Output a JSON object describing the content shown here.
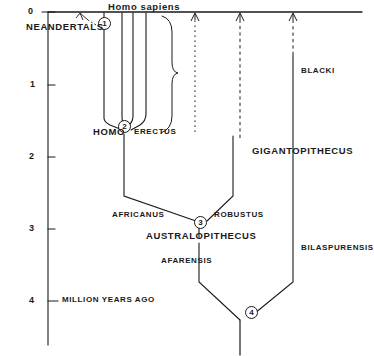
{
  "figure": {
    "type": "phylogenetic-tree-diagram",
    "style": "hand-drawn line art, black ink on white",
    "width": 364,
    "height": 356,
    "ink_color": "#1a1a1a",
    "background_color": "#ffffff"
  },
  "axis": {
    "orientation": "vertical-left",
    "label": "MILLION YEARS AGO",
    "label_x": 62,
    "label_y": 296,
    "ticks": [
      {
        "value": "0",
        "y": 12
      },
      {
        "value": "1",
        "y": 85
      },
      {
        "value": "2",
        "y": 157
      },
      {
        "value": "3",
        "y": 229
      },
      {
        "value": "4",
        "y": 301
      }
    ],
    "axis_x": 48,
    "axis_top": 12,
    "axis_bottom": 345,
    "units": "million years ago",
    "range": [
      0,
      4
    ]
  },
  "top_axis": {
    "present_line_y": 12,
    "present_line_x1": 48,
    "present_line_x2": 362
  },
  "taxa": [
    {
      "name": "Homo sapiens",
      "text": "Homo sapiens",
      "x": 108,
      "y": 4,
      "style": "cap"
    },
    {
      "name": "Neandertals",
      "text": "NEANDERTALS",
      "x": 26,
      "y": 24,
      "style": "cap"
    },
    {
      "name": "Homo erectus",
      "text": "HOMO",
      "x": 93,
      "y": 128,
      "style": "cap"
    },
    {
      "name": "Homo erectus species",
      "text": "ERECTUS",
      "x": 135,
      "y": 129,
      "style": "plain"
    },
    {
      "name": "africanus",
      "text": "AFRICANUS",
      "x": 112,
      "y": 212,
      "style": "plain"
    },
    {
      "name": "robustus",
      "text": "ROBUSTUS",
      "x": 214,
      "y": 212,
      "style": "plain"
    },
    {
      "name": "Australopithecus",
      "text": "AUSTRALOPITHECUS",
      "x": 146,
      "y": 232,
      "style": "cap"
    },
    {
      "name": "afarensis",
      "text": "AFARENSIS",
      "x": 161,
      "y": 258,
      "style": "plain"
    },
    {
      "name": "blacki",
      "text": "BLACKI",
      "x": 301,
      "y": 68,
      "style": "plain"
    },
    {
      "name": "Gigantopithecus",
      "text": "GIGANTOPITHECUS",
      "x": 252,
      "y": 147,
      "style": "cap"
    },
    {
      "name": "bilaspurensis",
      "text": "BILASPURENSIS",
      "x": 301,
      "y": 245,
      "style": "plain"
    }
  ],
  "nodes": [
    {
      "id": "1",
      "label": "1",
      "x": 104,
      "y": 23,
      "note": "Homo sapiens / Neandertals split"
    },
    {
      "id": "2",
      "label": "2",
      "x": 124,
      "y": 126,
      "note": "Homo erectus node"
    },
    {
      "id": "3",
      "label": "3",
      "x": 200,
      "y": 223,
      "note": "Australopithecus africanus / robustus node"
    },
    {
      "id": "4",
      "label": "4",
      "x": 251,
      "y": 313,
      "note": "common ancestor node"
    }
  ],
  "lineages": [
    {
      "name": "homo-sapiens-lineage",
      "x": 104,
      "from_y": 12,
      "to_y": 120,
      "line": "solid"
    },
    {
      "name": "erectus-branch-b",
      "x": 122,
      "from_y": 12,
      "to_y": 118,
      "line": "solid"
    },
    {
      "name": "erectus-branch-c",
      "x": 133,
      "from_y": 12,
      "to_y": 118,
      "line": "solid"
    },
    {
      "name": "erectus-branch-d",
      "x": 146,
      "from_y": 12,
      "to_y": 118,
      "line": "solid"
    },
    {
      "name": "dashed-lineage-1",
      "x": 195,
      "from_y": 18,
      "to_y": 132,
      "line": "dotted-with-arrow"
    },
    {
      "name": "dashed-lineage-2",
      "x": 240,
      "from_y": 18,
      "to_y": 138,
      "line": "dashed-with-arrow"
    },
    {
      "name": "gigantopithecus-lineage",
      "x": 293,
      "from_y": 18,
      "to_y": 282,
      "line": "dashed-then-solid-with-arrow"
    }
  ],
  "annotations": [
    {
      "name": "brace",
      "text": "",
      "x": 170,
      "y_top": 16,
      "y_bottom": 132,
      "meaning": "curly brace grouping the erectus-grade lineages"
    },
    {
      "name": "neandertal-pointer",
      "text": "",
      "from": [
        96,
        24
      ],
      "to": [
        82,
        14
      ],
      "line": "dashed-with-arrow"
    }
  ]
}
